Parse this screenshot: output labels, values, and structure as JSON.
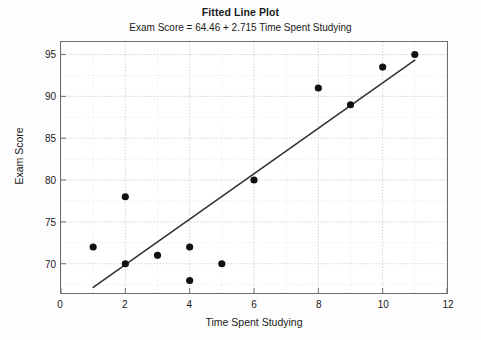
{
  "chart_data": {
    "type": "scatter",
    "title": "Fitted Line Plot",
    "subtitle": "Exam Score = 64.46 + 2.715 Time Spent Studying",
    "xlabel": "Time Spent Studying",
    "ylabel": "Exam Score",
    "xlim": [
      0,
      12
    ],
    "ylim": [
      66.5,
      96.5
    ],
    "xticks": [
      0,
      2,
      4,
      6,
      8,
      10,
      12
    ],
    "yticks": [
      70,
      75,
      80,
      85,
      90,
      95
    ],
    "x_minor_step": 1,
    "y_minor_step": 2.5,
    "grid": true,
    "legend": "none",
    "marker_color": "#111111",
    "line_color": "#333333",
    "grid_color": "#cccccc",
    "frame_color": "#6e6e6e",
    "points": [
      {
        "x": 1,
        "y": 72
      },
      {
        "x": 2,
        "y": 70
      },
      {
        "x": 2,
        "y": 78
      },
      {
        "x": 3,
        "y": 71
      },
      {
        "x": 4,
        "y": 72
      },
      {
        "x": 4,
        "y": 68
      },
      {
        "x": 5,
        "y": 70
      },
      {
        "x": 6,
        "y": 80
      },
      {
        "x": 8,
        "y": 91
      },
      {
        "x": 9,
        "y": 89
      },
      {
        "x": 10,
        "y": 93.5
      },
      {
        "x": 11,
        "y": 95
      }
    ],
    "fit_line": {
      "intercept": 64.46,
      "slope": 2.715,
      "x_start": 1,
      "x_end": 11
    }
  }
}
